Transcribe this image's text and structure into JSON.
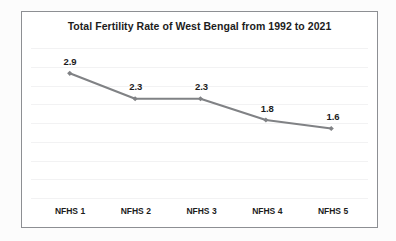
{
  "chart_data": {
    "type": "line",
    "title": "Total Fertility Rate of West Bengal from 1992 to 2021",
    "categories": [
      "NFHS 1",
      "NFHS 2",
      "NFHS 3",
      "NFHS 4",
      "NFHS 5"
    ],
    "values": [
      2.9,
      2.3,
      2.3,
      1.8,
      1.6
    ],
    "point_labels": [
      "2.9",
      "2.3",
      "2.3",
      "1.8",
      "1.6"
    ],
    "series": [
      {
        "name": "Total Fertility Rate",
        "values": [
          2.9,
          2.3,
          2.3,
          1.8,
          1.6
        ]
      }
    ],
    "xlabel": "",
    "ylabel": "",
    "ylim": [
      0,
      3.5
    ],
    "grid": true,
    "gridlines": 8,
    "legend": false,
    "legend_position": "none",
    "axis_tick_labels_y": [],
    "line_color": "#808285",
    "marker_color": "#808285",
    "marker_shape": "diamond",
    "gridline_color": "#f2f2f3",
    "border_color": "#8d8f93",
    "plot_background": "#ffffff",
    "page_background": "#fcfcfc",
    "text_color": "#1c1c1c"
  }
}
